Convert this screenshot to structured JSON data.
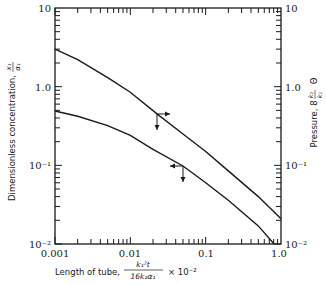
{
  "chart_data": {
    "type": "line",
    "title": "",
    "xscale": "log",
    "yscale": "log",
    "xlim": [
      0.001,
      1.0
    ],
    "ylim": [
      0.01,
      10
    ],
    "y2lim": [
      0.01,
      10
    ],
    "xlabel": "Length of tube, k1²t / (16 k2 α1) × 10⁻²",
    "ylabel": "Dimensionless concentration, x1/α1",
    "y2label": "Pressure, 8 (k2/k1) Θ",
    "x_ticks": [
      "0.001",
      "0.01",
      "0.1",
      "1.0"
    ],
    "y_ticks": [
      "10⁻²",
      "10⁻¹",
      "1.0",
      "10"
    ],
    "y2_ticks": [
      "10⁻²",
      "10⁻¹",
      "1.0",
      "10"
    ],
    "grid": false,
    "series": [
      {
        "name": "Pressure",
        "axis": "right",
        "marker_arrow": "right",
        "x": [
          0.001,
          0.002,
          0.005,
          0.01,
          0.0226,
          0.05,
          0.1,
          0.2,
          0.5,
          1.0
        ],
        "y": [
          3.0,
          2.2,
          1.3,
          0.85,
          0.45,
          0.25,
          0.15,
          0.085,
          0.04,
          0.021
        ]
      },
      {
        "name": "Dimensionless concentration",
        "axis": "left",
        "marker_arrow": "left",
        "x": [
          0.001,
          0.002,
          0.005,
          0.01,
          0.02,
          0.05,
          0.1,
          0.2,
          0.5,
          0.81
        ],
        "y": [
          0.49,
          0.42,
          0.32,
          0.24,
          0.16,
          0.098,
          0.06,
          0.036,
          0.017,
          0.01
        ]
      }
    ],
    "annotations": [
      {
        "type": "axis-indicator",
        "series": "Pressure",
        "x": 0.0226,
        "y": 0.45,
        "arrows": [
          "right",
          "down"
        ]
      },
      {
        "type": "axis-indicator",
        "series": "Dimensionless concentration",
        "x": 0.05,
        "y": 0.098,
        "arrows": [
          "left",
          "down"
        ]
      }
    ]
  },
  "labels": {
    "y_left_main": "Dimensionless concentration,",
    "y_left_frac_num": "x₁",
    "y_left_frac_den": "α₁",
    "y_right_main": "Pressure, 8",
    "y_right_frac_num": "k₂",
    "y_right_frac_den": "k₁",
    "y_right_tail": "Θ",
    "x_main": "Length of tube,",
    "x_frac_num": "k₁²t",
    "x_frac_den": "16k₂α₁",
    "x_tail": "× 10⁻²",
    "x_ticks": [
      "0.001",
      "0.01",
      "0.1",
      "1.0"
    ],
    "y_ticks_left": [
      "10⁻²",
      "10⁻¹",
      "1.0",
      "10"
    ],
    "y_ticks_right": [
      "10⁻²",
      "10⁻¹",
      "1.0",
      "10"
    ]
  },
  "colors": {
    "ink": "#1a1a1a",
    "background": "#ffffff"
  }
}
